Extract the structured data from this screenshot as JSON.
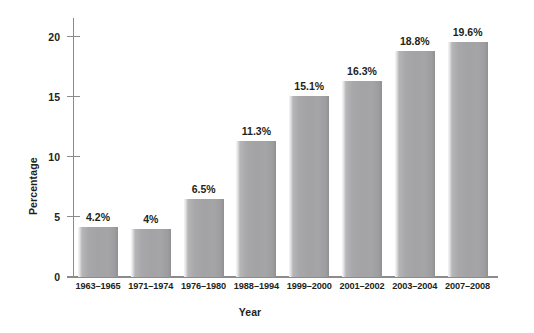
{
  "chart_data": {
    "type": "bar",
    "title": "",
    "xlabel": "Year",
    "ylabel": "Percentage",
    "categories": [
      "1963–1965",
      "1971–1974",
      "1976–1980",
      "1988–1994",
      "1999–2000",
      "2001–2002",
      "2003–2004",
      "2007–2008"
    ],
    "values": [
      4.2,
      4,
      6.5,
      11.3,
      15.1,
      16.3,
      18.8,
      19.6
    ],
    "data_labels": [
      "4.2%",
      "4%",
      "6.5%",
      "11.3%",
      "15.1%",
      "16.3%",
      "18.8%",
      "19.6%"
    ],
    "ylim": [
      0,
      21.5
    ],
    "yticks": [
      0,
      5,
      10,
      15,
      20
    ],
    "ytick_labels": [
      "0",
      "5",
      "10",
      "15",
      "20"
    ],
    "grid": false,
    "legend": false,
    "series_color": "#a3a3a5"
  }
}
